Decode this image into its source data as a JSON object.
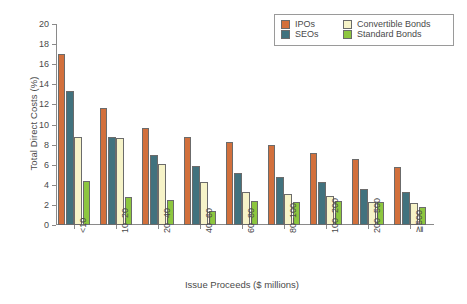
{
  "chart_data": {
    "type": "bar",
    "title": "",
    "xlabel": "Issue Proceeds ($ millions)",
    "ylabel": "Total Direct Costs (%)",
    "ylim": [
      0,
      20
    ],
    "yticks": [
      0,
      2,
      4,
      6,
      8,
      10,
      12,
      14,
      16,
      18,
      20
    ],
    "grid": false,
    "legend_position": "top-right",
    "categories": [
      "<10",
      "10–20",
      "20–40",
      "40–60",
      "60–80",
      "80–100",
      "100–200",
      "200–500",
      "≧500"
    ],
    "series": [
      {
        "name": "IPOs",
        "color": "#D2703C",
        "values": [
          17.0,
          11.6,
          9.7,
          8.8,
          8.3,
          8.0,
          7.15,
          6.6,
          5.8
        ]
      },
      {
        "name": "SEOs",
        "color": "#41727E",
        "values": [
          13.3,
          8.75,
          6.95,
          5.9,
          5.2,
          4.8,
          4.3,
          3.55,
          3.25
        ]
      },
      {
        "name": "Convertible Bonds",
        "color": "#F6F3C8",
        "values": [
          8.75,
          8.65,
          6.1,
          4.3,
          3.25,
          3.1,
          2.85,
          2.25,
          2.2
        ]
      },
      {
        "name": "Standard Bonds",
        "color": "#8DC63F",
        "values": [
          4.4,
          2.75,
          2.45,
          1.4,
          2.4,
          2.25,
          2.35,
          2.3,
          1.75
        ]
      }
    ]
  },
  "legend": {
    "items": [
      {
        "label": "IPOs"
      },
      {
        "label": "Convertible Bonds"
      },
      {
        "label": "SEOs"
      },
      {
        "label": "Standard Bonds"
      }
    ]
  }
}
